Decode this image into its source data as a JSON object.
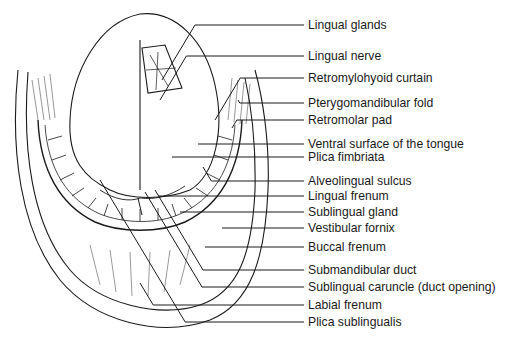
{
  "figure": {
    "labels": [
      {
        "text": "Lingual glands",
        "y": 25,
        "end": [
          162,
          80
        ]
      },
      {
        "text": "Lingual nerve",
        "y": 56,
        "end": [
          160,
          100
        ]
      },
      {
        "text": "Retromylohyoid curtain",
        "y": 78,
        "end": [
          215,
          120
        ]
      },
      {
        "text": "Pterygomandibular fold",
        "y": 103,
        "end": [
          238,
          100
        ]
      },
      {
        "text": "Retromolar pad",
        "y": 120,
        "end": [
          232,
          128
        ]
      },
      {
        "text": "Ventral surface of the tongue",
        "y": 144,
        "end": [
          198,
          144
        ]
      },
      {
        "text": "Plica fimbriata",
        "y": 157,
        "end": [
          172,
          157
        ]
      },
      {
        "text": "Alveolingual sulcus",
        "y": 181,
        "end": [
          203,
          167
        ]
      },
      {
        "text": "Lingual frenum",
        "y": 196,
        "end": [
          158,
          196
        ]
      },
      {
        "text": "Sublingual gland",
        "y": 212,
        "end": [
          180,
          212
        ]
      },
      {
        "text": "Vestibular fornix",
        "y": 228,
        "end": [
          222,
          228
        ]
      },
      {
        "text": "Buccal frenum",
        "y": 247,
        "end": [
          205,
          247
        ]
      },
      {
        "text": "Submandibular duct",
        "y": 270,
        "end": [
          155,
          190
        ]
      },
      {
        "text": "Sublingual caruncle (duct opening)",
        "y": 287,
        "end": [
          145,
          192
        ]
      },
      {
        "text": "Labial frenum",
        "y": 305,
        "end": [
          140,
          283
        ]
      },
      {
        "text": "Plica sublingualis",
        "y": 322,
        "end": [
          100,
          180
        ]
      }
    ]
  },
  "colors": {
    "ink": "#1a1a1a",
    "background": "#ffffff"
  }
}
